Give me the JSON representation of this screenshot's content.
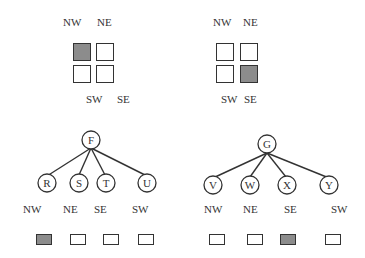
{
  "colors": {
    "filled": "#8c8c8c",
    "empty": "#ffffff",
    "stroke": "#333333"
  },
  "grids": [
    {
      "labels": {
        "nw": "NW",
        "ne": "NE",
        "sw": "SW",
        "se": "SE"
      },
      "filled_quadrant": "NW"
    },
    {
      "labels": {
        "nw": "NW",
        "ne": "NE",
        "sw": "SW",
        "se": "SE"
      },
      "filled_quadrant": "SE"
    }
  ],
  "trees": [
    {
      "root": "F",
      "children": [
        "R",
        "S",
        "T",
        "U"
      ],
      "child_labels": [
        "NW",
        "NE",
        "SE",
        "SW"
      ],
      "filled_index": 0
    },
    {
      "root": "G",
      "children": [
        "V",
        "W",
        "X",
        "Y"
      ],
      "child_labels": [
        "NW",
        "NE",
        "SE",
        "SW"
      ],
      "filled_index": 2
    }
  ]
}
